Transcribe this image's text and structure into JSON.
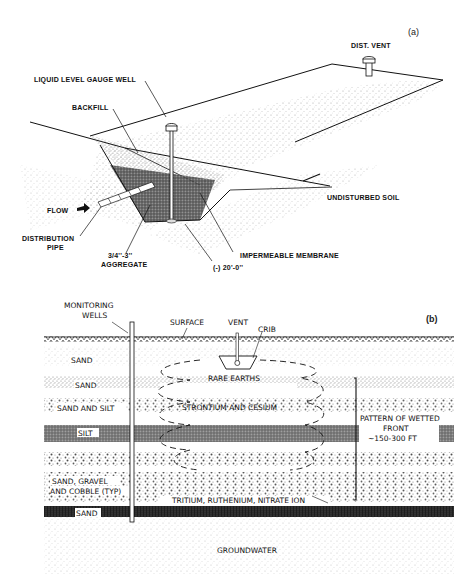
{
  "panel_a": {
    "tag": "(a)",
    "labels": {
      "dist_vent": "DIST. VENT",
      "liquid_level_gauge_well": "LIQUID LEVEL GAUGE WELL",
      "backfill": "BACKFILL",
      "undisturbed_soil": "UNDISTURBED SOIL",
      "flow": "FLOW",
      "distribution_pipe_1": "DISTRIBUTION",
      "distribution_pipe_2": "PIPE",
      "aggregate_1": "3/4''-3''",
      "aggregate_2": "AGGREGATE",
      "impermeable_membrane": "IMPERMEABLE MEMBRANE",
      "depth": "(-) 20'-0''"
    }
  },
  "panel_b": {
    "tag": "(b)",
    "labels": {
      "monitoring_wells_1": "MONITORING",
      "monitoring_wells_2": "WELLS",
      "surface": "SURFACE",
      "vent": "VENT",
      "crib": "CRIB",
      "rare_earths": "RARE EARTHS",
      "strontium_cesium": "STRONTIUM AND CESIUM",
      "tritium": "TRITIUM, RUTHENIUM, NITRATE ION",
      "wetted_front_1": "PATTERN OF WETTED",
      "wetted_front_2": "FRONT",
      "wetted_front_3": "~150-300 FT",
      "groundwater": "GROUNDWATER"
    },
    "strata": [
      {
        "label": "SAND"
      },
      {
        "label": "SAND"
      },
      {
        "label": "SAND AND SILT"
      },
      {
        "label": "SILT"
      },
      {
        "label": ""
      },
      {
        "label": "SAND, GRAVEL"
      },
      {
        "label": "AND COBBLE (TYP)"
      },
      {
        "label": "SAND"
      }
    ]
  },
  "colors": {
    "ink": "#111111",
    "stipple": "#9a9a9a",
    "dark_layer": "#2a2a2a"
  }
}
